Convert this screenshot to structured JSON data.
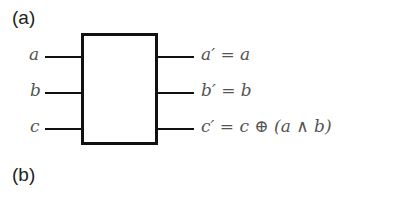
{
  "panels": {
    "a": {
      "label": "(a)"
    },
    "b": {
      "label": "(b)"
    }
  },
  "gate": {
    "type": "Toffoli",
    "inputs": [
      {
        "label": "a"
      },
      {
        "label": "b"
      },
      {
        "label": "c"
      }
    ],
    "outputs": [
      {
        "label": "a′ = a"
      },
      {
        "label": "b′ = b"
      },
      {
        "label": "c′ = c ⊕ (a ∧ b)"
      }
    ]
  }
}
